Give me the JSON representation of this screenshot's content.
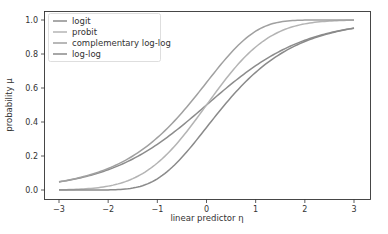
{
  "chart_data": {
    "type": "line",
    "title": "",
    "xlabel": "linear predictor η",
    "ylabel": "probability μ",
    "xlim": [
      -3.3,
      3.3
    ],
    "ylim": [
      -0.05,
      1.05
    ],
    "xticks": [
      -3,
      -2,
      -1,
      0,
      1,
      2,
      3
    ],
    "xtick_labels": [
      "−3",
      "−2",
      "−1",
      "0",
      "1",
      "2",
      "3"
    ],
    "yticks": [
      0.0,
      0.2,
      0.4,
      0.6,
      0.8,
      1.0
    ],
    "ytick_labels": [
      "0.0",
      "0.2",
      "0.4",
      "0.6",
      "0.8",
      "1.0"
    ],
    "grid": false,
    "legend_position": "upper left",
    "x": [
      -3,
      -2.5,
      -2,
      -1.5,
      -1,
      -0.5,
      0,
      0.5,
      1,
      1.5,
      2,
      2.5,
      3
    ],
    "series": [
      {
        "name": "logit",
        "color": "#8c8c8c",
        "values": [
          0.0474,
          0.0759,
          0.1192,
          0.1824,
          0.2689,
          0.3775,
          0.5,
          0.6225,
          0.7311,
          0.8176,
          0.8808,
          0.9241,
          0.9526
        ]
      },
      {
        "name": "probit",
        "color": "#b4b4b4",
        "values": [
          0.0013,
          0.0062,
          0.0228,
          0.0668,
          0.1587,
          0.3085,
          0.5,
          0.6915,
          0.8413,
          0.9332,
          0.9772,
          0.9938,
          0.9987
        ]
      },
      {
        "name": "complementary log-log",
        "color": "#a0a0a0",
        "values": [
          0.0486,
          0.0788,
          0.1266,
          0.2,
          0.3078,
          0.4548,
          0.6321,
          0.8077,
          0.934,
          0.9887,
          0.9994,
          1.0,
          1.0
        ]
      },
      {
        "name": "log-log",
        "color": "#8a8a8a",
        "values": [
          0.0,
          0.0,
          0.0006,
          0.0113,
          0.066,
          0.1923,
          0.3679,
          0.5452,
          0.6922,
          0.8,
          0.8734,
          0.9212,
          0.9514
        ]
      }
    ]
  },
  "legend": {
    "items": [
      {
        "label": "logit"
      },
      {
        "label": "probit"
      },
      {
        "label": "complementary log-log"
      },
      {
        "label": "log-log"
      }
    ]
  },
  "axes": {
    "xlabel": "linear predictor η",
    "ylabel": "probability μ"
  }
}
